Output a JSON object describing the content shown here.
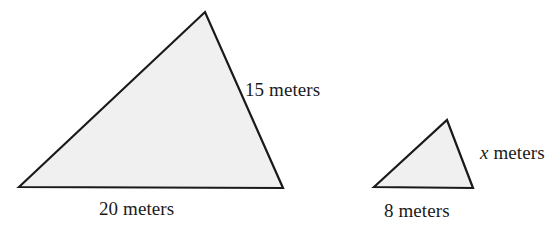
{
  "figure": {
    "background_color": "#ffffff",
    "fill_color": "#f0f0f0",
    "stroke_color": "#1a1a1a",
    "stroke_width": 2,
    "canvas": {
      "width": 557,
      "height": 233
    }
  },
  "shapes": [
    {
      "name": "large-triangle",
      "vertices": [
        [
          19,
          187
        ],
        [
          205,
          12
        ],
        [
          283,
          188
        ]
      ],
      "labels": {
        "hypotenuse": "15 meters",
        "base": "20 meters"
      }
    },
    {
      "name": "small-triangle",
      "vertices": [
        [
          374,
          187
        ],
        [
          447,
          120
        ],
        [
          473,
          188
        ]
      ],
      "labels": {
        "hypotenuse": "x meters",
        "base": "8 meters"
      }
    }
  ],
  "labels": {
    "large_right_side": "15 meters",
    "large_base": "20 meters",
    "small_right_side_variable": "x",
    "small_right_side_unit": " meters",
    "small_base": "8 meters"
  },
  "chart_data": {
    "type": "diagram",
    "items": [
      {
        "shape": "large triangle",
        "base": "20 meters",
        "right_side": "15 meters"
      },
      {
        "shape": "small triangle",
        "base": "8 meters",
        "right_side": "x meters"
      }
    ]
  }
}
